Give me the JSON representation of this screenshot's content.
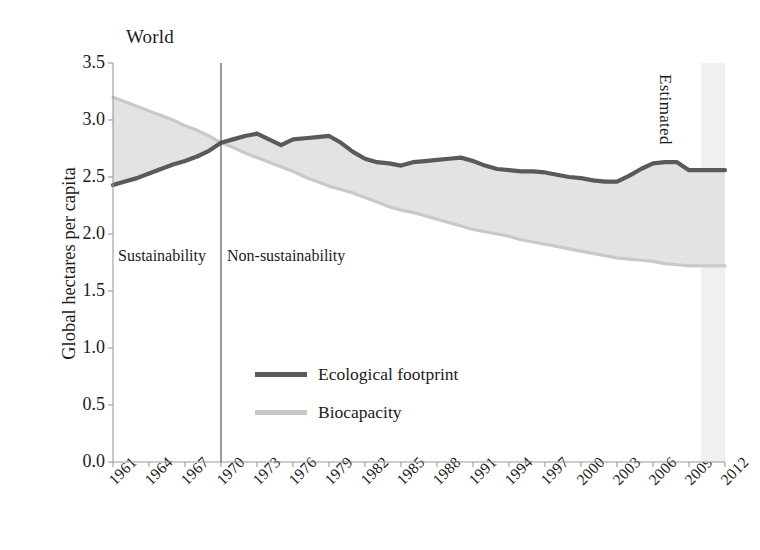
{
  "chart_data": {
    "type": "area",
    "title": "World",
    "xlabel": "",
    "ylabel": "Global hectares per capita",
    "ylim": [
      0.0,
      3.5
    ],
    "xlim": [
      1961,
      2012
    ],
    "grid": false,
    "legend_position": "center",
    "ytick_labels": [
      "3.5",
      "3.0",
      "2.5",
      "2.0",
      "1.5",
      "1.0",
      "0.5",
      "0.0"
    ],
    "ytick_values": [
      3.5,
      3.0,
      2.5,
      2.0,
      1.5,
      1.0,
      0.5,
      0.0
    ],
    "xtick_labels": [
      "1961",
      "1964",
      "1967",
      "1970",
      "1973",
      "1976",
      "1979",
      "1982",
      "1985",
      "1988",
      "1991",
      "1994",
      "1997",
      "2000",
      "2003",
      "2006",
      "2009",
      "2012"
    ],
    "xtick_values": [
      1961,
      1964,
      1967,
      1970,
      1973,
      1976,
      1979,
      1982,
      1985,
      1988,
      1991,
      1994,
      1997,
      2000,
      2003,
      2006,
      2009,
      2012
    ],
    "x": [
      1961,
      1962,
      1963,
      1964,
      1965,
      1966,
      1967,
      1968,
      1969,
      1970,
      1971,
      1972,
      1973,
      1974,
      1975,
      1976,
      1977,
      1978,
      1979,
      1980,
      1981,
      1982,
      1983,
      1984,
      1985,
      1986,
      1987,
      1988,
      1989,
      1990,
      1991,
      1992,
      1993,
      1994,
      1995,
      1996,
      1997,
      1998,
      1999,
      2000,
      2001,
      2002,
      2003,
      2004,
      2005,
      2006,
      2007,
      2008,
      2009,
      2010,
      2011,
      2012
    ],
    "series": [
      {
        "name": "Ecological footprint",
        "color": "#5a5a5a",
        "values": [
          2.43,
          2.46,
          2.49,
          2.53,
          2.57,
          2.61,
          2.64,
          2.68,
          2.73,
          2.8,
          2.83,
          2.86,
          2.88,
          2.83,
          2.78,
          2.83,
          2.84,
          2.85,
          2.86,
          2.8,
          2.72,
          2.66,
          2.63,
          2.62,
          2.6,
          2.63,
          2.64,
          2.65,
          2.66,
          2.67,
          2.64,
          2.6,
          2.57,
          2.56,
          2.55,
          2.55,
          2.54,
          2.52,
          2.5,
          2.49,
          2.47,
          2.46,
          2.46,
          2.51,
          2.57,
          2.62,
          2.63,
          2.63,
          2.56,
          2.56,
          2.56,
          2.56
        ]
      },
      {
        "name": "Biocapacity",
        "color": "#c9c9c9",
        "values": [
          3.2,
          3.16,
          3.12,
          3.08,
          3.04,
          3.0,
          2.95,
          2.91,
          2.86,
          2.8,
          2.76,
          2.71,
          2.67,
          2.63,
          2.59,
          2.55,
          2.5,
          2.46,
          2.42,
          2.39,
          2.36,
          2.32,
          2.28,
          2.24,
          2.21,
          2.19,
          2.16,
          2.13,
          2.1,
          2.07,
          2.04,
          2.02,
          2.0,
          1.98,
          1.95,
          1.93,
          1.91,
          1.89,
          1.87,
          1.85,
          1.83,
          1.81,
          1.79,
          1.78,
          1.77,
          1.76,
          1.74,
          1.73,
          1.72,
          1.72,
          1.72,
          1.72
        ]
      }
    ],
    "annotations": [
      {
        "text": "Sustainability",
        "x": 1963,
        "y": 1.85
      },
      {
        "text": "Non-sustainability",
        "x": 1972,
        "y": 1.85
      },
      {
        "text": "Estimated",
        "x": 2010.5,
        "y": 3.25,
        "rotation": 90
      }
    ],
    "reference_lines": [
      {
        "type": "vertical",
        "x": 1970,
        "label": "sustainability-divider"
      }
    ],
    "shaded_regions": [
      {
        "label": "Estimated",
        "x_start": 2010,
        "x_end": 2012,
        "color": "#f0f0f0"
      }
    ]
  },
  "legend": {
    "items": [
      {
        "label": "Ecological footprint",
        "style": "footprint"
      },
      {
        "label": "Biocapacity",
        "style": "biocapacity"
      }
    ]
  },
  "colors": {
    "footprint_line": "#5a5a5a",
    "biocapacity_line": "#c9c9c9",
    "band_fill": "#e3e3e3",
    "estimated_band": "#f0f0f0",
    "axis": "#9a9a9a",
    "text": "#1b1b1b"
  }
}
